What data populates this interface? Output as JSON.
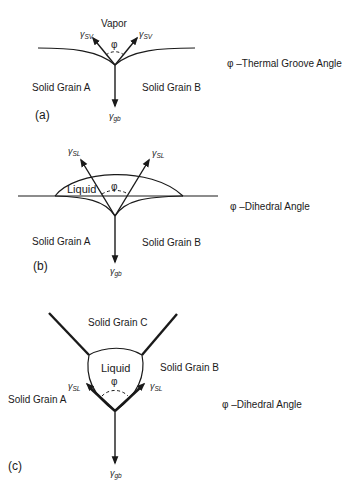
{
  "diagram": {
    "panel_a": {
      "tag": "(a)",
      "phase_label": "Vapor",
      "left_grain": "Solid Grain A",
      "right_grain": "Solid Grain B",
      "surface_tension_left": {
        "symbol": "γ",
        "subscript": "SV"
      },
      "surface_tension_right": {
        "symbol": "γ",
        "subscript": "SV"
      },
      "grain_boundary_tension": {
        "symbol": "γ",
        "subscript": "gb"
      },
      "angle_symbol": "φ",
      "legend": "φ –Thermal Groove Angle"
    },
    "panel_b": {
      "tag": "(b)",
      "phase_label": "Liquid",
      "left_grain": "Solid Grain A",
      "right_grain": "Solid Grain B",
      "surface_tension_left": {
        "symbol": "γ",
        "subscript": "SL"
      },
      "surface_tension_right": {
        "symbol": "γ",
        "subscript": "SL"
      },
      "grain_boundary_tension": {
        "symbol": "γ",
        "subscript": "gb"
      },
      "angle_symbol": "φ",
      "legend": "φ –Dihedral Angle"
    },
    "panel_c": {
      "tag": "(c)",
      "phase_label": "Liquid",
      "top_grain": "Solid Grain C",
      "left_grain": "Solid Grain A",
      "right_grain": "Solid Grain B",
      "surface_tension_left": {
        "symbol": "γ",
        "subscript": "SL"
      },
      "surface_tension_right": {
        "symbol": "γ",
        "subscript": "SL"
      },
      "grain_boundary_tension": {
        "symbol": "γ",
        "subscript": "gb"
      },
      "angle_symbol": "φ",
      "legend": "φ –Dihedral Angle"
    }
  }
}
